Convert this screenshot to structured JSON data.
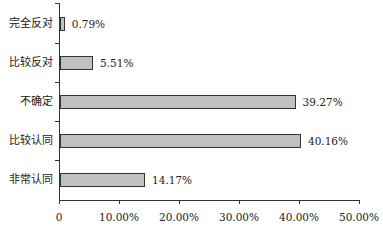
{
  "chart_data": {
    "type": "bar",
    "orientation": "horizontal",
    "title": "",
    "xlabel": "",
    "ylabel": "",
    "categories": [
      "完全反对",
      "比较反对",
      "不确定",
      "比较认同",
      "非常认同"
    ],
    "values": [
      0.79,
      5.51,
      39.27,
      40.16,
      14.17
    ],
    "value_labels": [
      "0.79%",
      "5.51%",
      "39.27%",
      "40.16%",
      "14.17%"
    ],
    "xlim": [
      0,
      50
    ],
    "xticks": [
      0,
      10,
      20,
      30,
      40,
      50
    ],
    "xtick_labels": [
      "0",
      "10.00%",
      "20.00%",
      "30.00%",
      "40.00%",
      "50.00%"
    ],
    "grid": false,
    "legend": null,
    "bar_color": "#c0c0c0",
    "bar_edge_color": "#333333"
  }
}
